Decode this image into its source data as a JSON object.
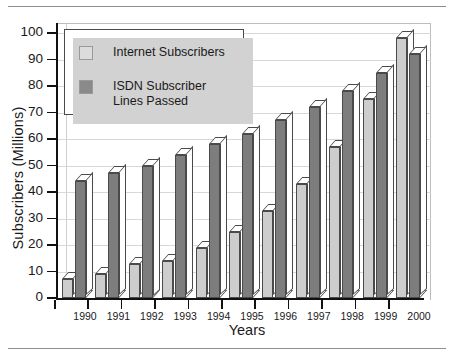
{
  "chart_data": {
    "type": "bar",
    "title": "",
    "xlabel": "Years",
    "ylabel": "Subscribers (Millions)",
    "ylim": [
      0,
      100
    ],
    "ytick_step": 10,
    "yticks": [
      "100",
      "90",
      "80",
      "70",
      "60",
      "50",
      "40",
      "30",
      "20",
      "10",
      "0"
    ],
    "grid": true,
    "legend_position": "upper-left-inside",
    "categories": [
      "1990",
      "1991",
      "1992",
      "1993",
      "1994",
      "1995",
      "1996",
      "1997",
      "1998",
      "1999",
      "2000"
    ],
    "series": [
      {
        "name": "Internet Subscribers",
        "color": "#cdcdcd",
        "values": [
          7,
          9,
          13,
          14,
          19,
          25,
          33,
          43,
          57,
          75,
          98
        ]
      },
      {
        "name": "ISDN Subscriber\nLines Passed",
        "color": "#7d7d7d",
        "values": [
          44,
          47,
          50,
          54,
          58,
          62,
          67,
          72,
          78,
          85,
          92
        ]
      }
    ]
  },
  "legend": {
    "items": [
      {
        "label": "Internet Subscribers",
        "swatch": "light-gray"
      },
      {
        "label": "ISDN Subscriber\nLines Passed",
        "swatch": "dark-gray"
      }
    ]
  },
  "axes": {
    "x_title": "Years",
    "y_title": "Subscribers (Millions)"
  }
}
